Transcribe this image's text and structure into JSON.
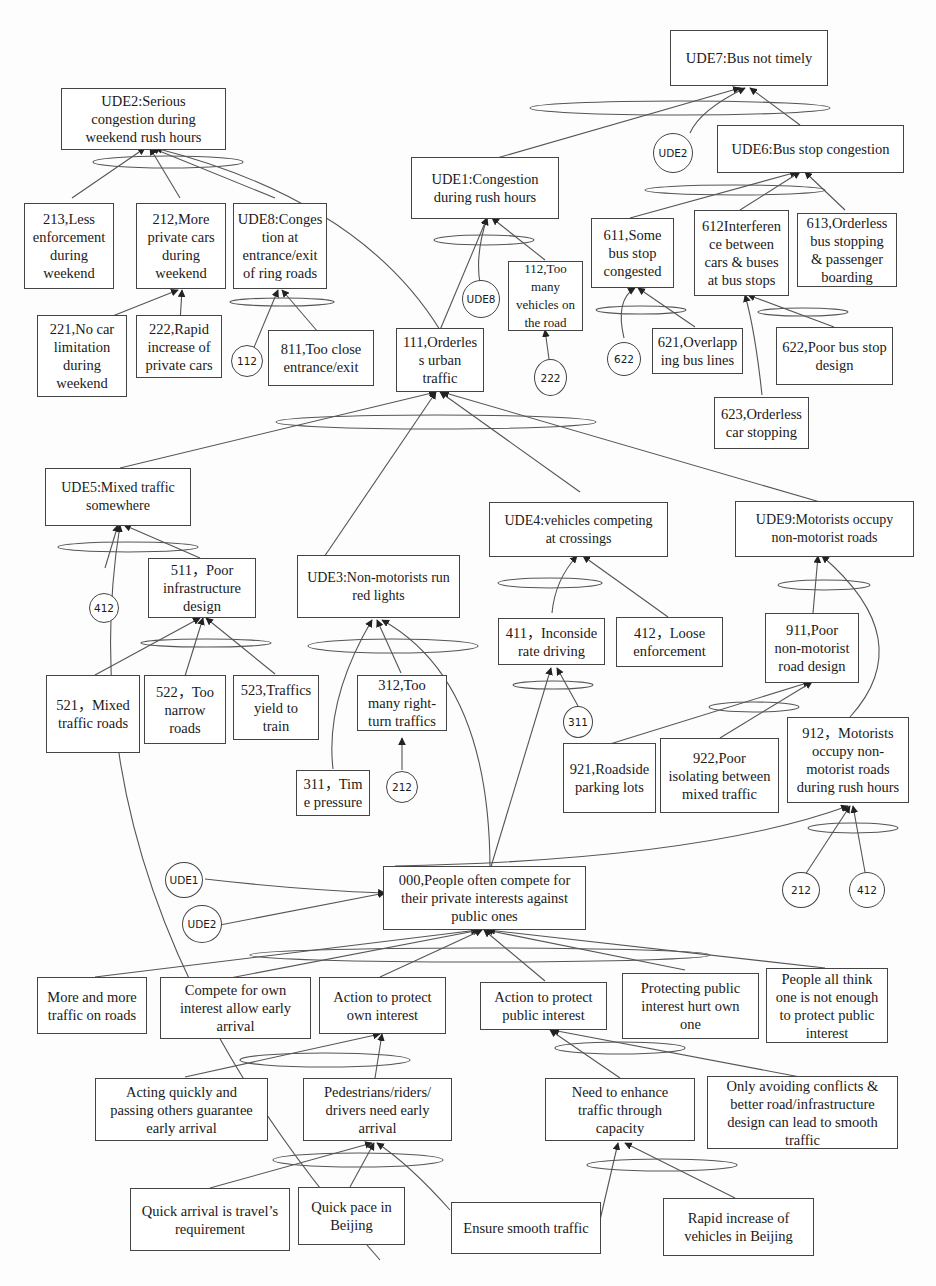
{
  "diagram": {
    "nodes": {
      "ude7": "UDE7:Bus not timely",
      "ude2": "UDE2:Serious\ncongestion during\nweekend rush hours",
      "ude1": "UDE1:Congestion\nduring rush hours",
      "ude6": "UDE6:Bus stop congestion",
      "n213": "213,Less\nenforcement\nduring\nweekend",
      "n212": "212,More\nprivate cars\nduring\nweekend",
      "ude8": "UDE8:Conges\ntion at\nentrance/exit\nof ring roads",
      "n611": "611,Some\nbus stop\ncongested",
      "n612": "612Interferen\nce between\ncars & buses\nat bus stops",
      "n613": "613,Orderless\nbus stopping\n& passenger\nboarding",
      "n112": "112,Too\nmany\nvehicles on\nthe road",
      "n221": "221,No car\nlimitation\nduring\nweekend",
      "n222": "222,Rapid\nincrease of\nprivate cars",
      "n811": "811,Too close\nentrance/exit",
      "n111": "111,Orderles\ns urban\ntraffic",
      "n621": "621,Overlapp\ning bus lines",
      "n622": "622,Poor bus stop\ndesign",
      "n623": "623,Orderless\ncar stopping",
      "ude5": "UDE5:Mixed traffic\nsomewhere",
      "ude4": "UDE4:vehicles competing\nat crossings",
      "ude9": "UDE9:Motorists occupy\nnon-motorist roads",
      "n511": "511，Poor\ninfrastructure\ndesign",
      "ude3": "UDE3:Non-motorists run\nred lights",
      "n411": "411，Inconside\nrate driving",
      "n412": "412，Loose\nenforcement",
      "n911": "911,Poor\nnon-motorist\nroad design",
      "n521": "521，Mixed\ntraffic roads",
      "n522": "522，Too\nnarrow\nroads",
      "n523": "523,Traffics\nyield to\ntrain",
      "n312": "312,Too\nmany right-\nturn traffics",
      "n921": "921,Roadside\nparking lots",
      "n922": "922,Poor\nisolating between\nmixed traffic",
      "n912": "912，Motorists\noccupy non-\nmotorist roads\nduring rush hours",
      "n311": "311，Tim\ne pressure",
      "n000": "000,People often compete for\ntheir private interests against\npublic ones",
      "b1": "More and more\ntraffic on roads",
      "b2": "Compete for own\ninterest allow early\narrival",
      "b3": "Action to protect\nown interest",
      "b4": "Action to protect\npublic interest",
      "b5": "Protecting public\ninterest hurt own\none",
      "b6": "People all think\none is not enough\nto protect public\ninterest",
      "b7": "Acting quickly and\npassing others guarantee\nearly arrival",
      "b8": "Pedestrians/riders/\ndrivers need early\narrival",
      "b9": "Need to enhance\ntraffic through\ncapacity",
      "b10": "Only avoiding conflicts &\nbetter road/infrastructure\ndesign can lead to smooth\ntraffic",
      "b11": "Quick arrival is travel’s\nrequirement",
      "b12": "Quick pace in\nBeijing",
      "b13": "Ensure smooth traffic",
      "b14": "Rapid increase of\nvehicles in Beijing"
    },
    "refs": {
      "r_ude2_top": "UDE2",
      "r_ude8": "UDE8",
      "r_112": "112",
      "r_222": "222",
      "r_622": "622",
      "r_412a": "412",
      "r_311": "311",
      "r_212a": "212",
      "r_212b": "212",
      "r_412b": "412",
      "r_ude1": "UDE1",
      "r_ude2": "UDE2"
    },
    "colors": {
      "line": "#444444",
      "background": "#fdfdfd"
    }
  }
}
